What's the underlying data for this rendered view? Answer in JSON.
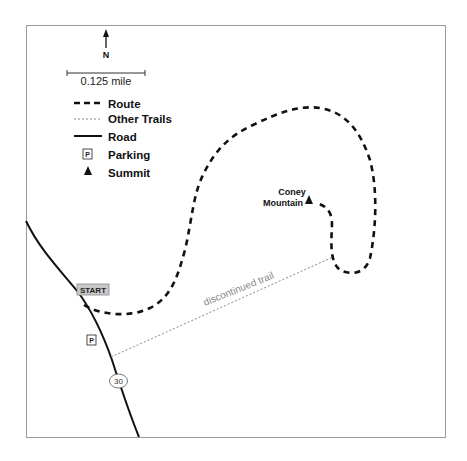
{
  "map": {
    "north_label": "N",
    "scale_label": "0.125 mile",
    "legend": {
      "route": "Route",
      "other_trails": "Other Trails",
      "road": "Road",
      "parking": "Parking",
      "summit": "Summit"
    },
    "parking_symbol": "P",
    "summit_name_line1": "Coney",
    "summit_name_line2": "Mountain",
    "start_label": "START",
    "trail_label": "discontinued trail",
    "road_number": "30",
    "colors": {
      "frame": "#999999",
      "route": "#111111",
      "other_trail": "#888888",
      "road": "#111111",
      "start_fill": "#c8c8c8"
    }
  }
}
